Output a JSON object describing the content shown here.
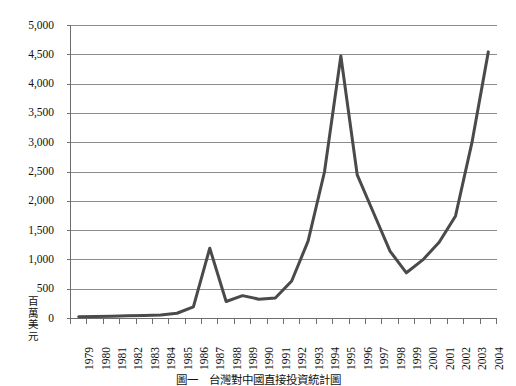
{
  "chart_data": {
    "type": "line",
    "title": "",
    "xlabel": "",
    "ylabel": "百萬美元",
    "ylabel_chars": [
      "百",
      "萬",
      "美",
      "元"
    ],
    "ylim": [
      0,
      5000
    ],
    "ytick_step": 500,
    "grid": true,
    "legend": "none",
    "line_color": "#4a4a4a",
    "line_width": 3,
    "ytick_labels": [
      "0",
      "500",
      "1,000",
      "1,500",
      "2,000",
      "2,500",
      "3,000",
      "3,500",
      "4,000",
      "4,500",
      "5,000"
    ],
    "ytick_values": [
      0,
      500,
      1000,
      1500,
      2000,
      2500,
      3000,
      3500,
      4000,
      4500,
      5000
    ],
    "categories": [
      "1979",
      "1980",
      "1981",
      "1982",
      "1983",
      "1984",
      "1985",
      "1986",
      "1987",
      "1988",
      "1989",
      "1990",
      "1991",
      "1992",
      "1993",
      "1994",
      "1995",
      "1996",
      "1997",
      "1998",
      "1999",
      "2000",
      "2001",
      "2002",
      "2003",
      "2004"
    ],
    "values": [
      30,
      35,
      40,
      45,
      50,
      60,
      90,
      200,
      1200,
      290,
      390,
      330,
      350,
      640,
      1320,
      2500,
      4480,
      2450,
      1800,
      1150,
      780,
      1000,
      1300,
      1750,
      3000,
      4550
    ]
  },
  "caption": {
    "text": "圖一　台灣對中國直接投資統計圖"
  },
  "axes": {
    "x_axis_name": "年份",
    "y_axis_name": "百萬美元"
  }
}
